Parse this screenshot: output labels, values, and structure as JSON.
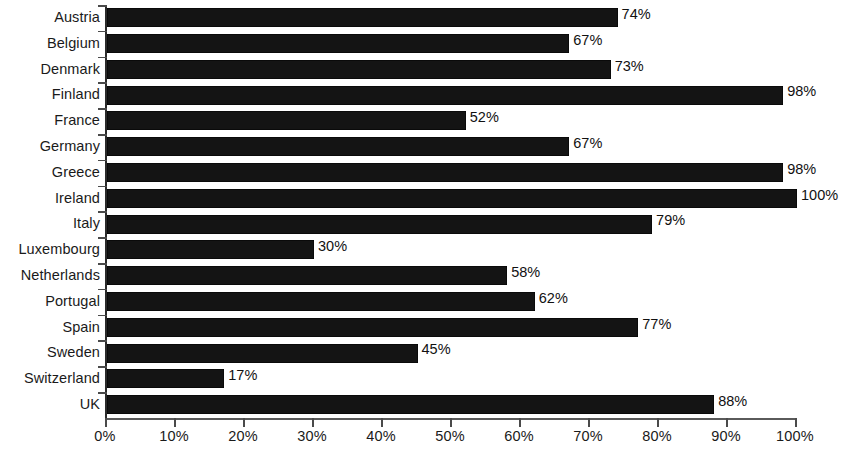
{
  "chart_data": {
    "type": "bar",
    "orientation": "horizontal",
    "title": "",
    "subtitle": "",
    "xlabel": "",
    "ylabel": "",
    "xlim": [
      0,
      100
    ],
    "grid": false,
    "legend": null,
    "value_suffix": "%",
    "categories": [
      "Austria",
      "Belgium",
      "Denmark",
      "Finland",
      "France",
      "Germany",
      "Greece",
      "Ireland",
      "Italy",
      "Luxembourg",
      "Netherlands",
      "Portugal",
      "Spain",
      "Sweden",
      "Switzerland",
      "UK"
    ],
    "values": [
      74,
      67,
      73,
      98,
      52,
      67,
      98,
      100,
      79,
      30,
      58,
      62,
      77,
      45,
      17,
      88
    ],
    "data_labels": [
      "74%",
      "67%",
      "73%",
      "98%",
      "52%",
      "67%",
      "98%",
      "100%",
      "79%",
      "30%",
      "58%",
      "62%",
      "77%",
      "45%",
      "17%",
      "88%"
    ],
    "xticks": [
      0,
      10,
      20,
      30,
      40,
      50,
      60,
      70,
      80,
      90,
      100
    ],
    "xtick_labels": [
      "0%",
      "10%",
      "20%",
      "30%",
      "40%",
      "50%",
      "60%",
      "70%",
      "80%",
      "90%",
      "100%"
    ],
    "bar_color": "#141414",
    "axis_color": "#4a4a4a",
    "text_color": "#1a1a1a",
    "background_color": "#ffffff"
  }
}
